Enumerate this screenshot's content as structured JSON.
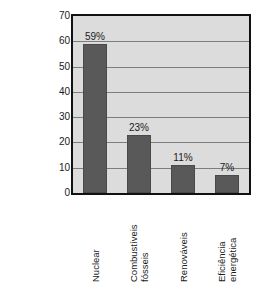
{
  "chart_data": {
    "type": "bar",
    "title": "",
    "xlabel": "",
    "ylabel_lines": [
      "Gastos dos Estados Unidos em",
      "P&D, 1949–1999",
      "(% de 110 bilhões de dólares)"
    ],
    "categories": [
      "Nuclear",
      "Combustíveis fósseis",
      "Renováveis",
      "Eficiência energética"
    ],
    "category_lines": [
      [
        "Nuclear"
      ],
      [
        "Combustíveis",
        "fósseis"
      ],
      [
        "Renováveis"
      ],
      [
        "Eficiência",
        "energética"
      ]
    ],
    "values": [
      59,
      23,
      11,
      7
    ],
    "value_labels": [
      "59%",
      "23%",
      "11%",
      "7%"
    ],
    "ylim": [
      0,
      70
    ],
    "ytick_values": [
      70,
      60,
      50,
      40,
      30,
      20,
      10,
      0
    ],
    "ytick_labels": [
      "70",
      "60",
      "50",
      "40",
      "30",
      "20",
      "10",
      "0"
    ],
    "grid": true,
    "legend": "none",
    "colors": {
      "bar_fill": "#595959",
      "plot_background": "#dcdcdc",
      "gridline": "#7d7d7d",
      "frame": "#111111",
      "figure_background": "#ffffff",
      "text": "#1a1a1a"
    }
  }
}
